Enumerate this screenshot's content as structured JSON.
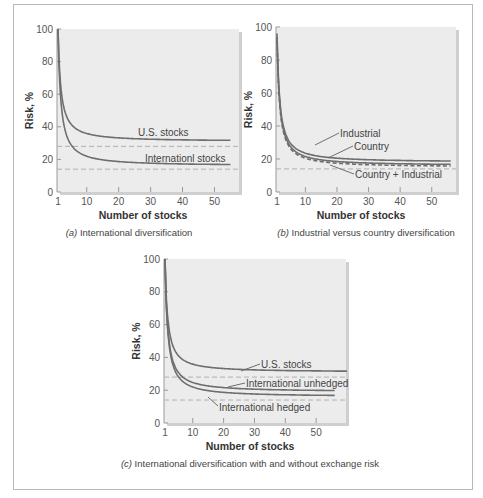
{
  "chart_data": [
    {
      "type": "line",
      "panel": "a",
      "title": "(a) International diversification",
      "caption_letter": "(a)",
      "caption_text": "International diversification",
      "xlabel": "Number of stocks",
      "ylabel": "Risk, %",
      "xlim": [
        1,
        58
      ],
      "ylim": [
        0,
        100
      ],
      "xticks": [
        1,
        10,
        20,
        30,
        40,
        50
      ],
      "yticks": [
        0,
        20,
        40,
        60,
        80,
        100
      ],
      "grid": false,
      "series": [
        {
          "name": "U.S. stocks",
          "asymptote": 31,
          "x": [
            1,
            2,
            3,
            5,
            10,
            20,
            30,
            40,
            50,
            55
          ],
          "values": [
            100,
            62,
            49,
            40,
            35,
            33,
            32,
            31.5,
            31,
            31
          ]
        },
        {
          "name": "Internationl stocks",
          "asymptote": 16,
          "x": [
            1,
            2,
            3,
            5,
            10,
            20,
            30,
            40,
            50,
            55
          ],
          "values": [
            100,
            55,
            40,
            28,
            21,
            18,
            17,
            16.5,
            16,
            16
          ]
        }
      ],
      "reference_lines": [
        {
          "y": 28,
          "style": "dashed"
        },
        {
          "y": 14,
          "style": "dashed"
        }
      ]
    },
    {
      "type": "line",
      "panel": "b",
      "title": "(b) Industrial versus country diversification",
      "caption_letter": "(b)",
      "caption_text": "Industrial versus country diversification",
      "xlabel": "Number of stocks",
      "ylabel": "Risk, %",
      "xlim": [
        1,
        58
      ],
      "ylim": [
        0,
        100
      ],
      "xticks": [
        1,
        10,
        20,
        30,
        40,
        50
      ],
      "yticks": [
        0,
        20,
        40,
        60,
        80,
        100
      ],
      "grid": false,
      "series": [
        {
          "name": "Industrial",
          "asymptote": 18,
          "x": [
            1,
            2,
            3,
            5,
            10,
            20,
            30,
            40,
            50,
            56
          ],
          "values": [
            96,
            70,
            55,
            40,
            28,
            22,
            20,
            19,
            18.5,
            18
          ]
        },
        {
          "name": "Country",
          "asymptote": 16,
          "x": [
            1,
            2,
            3,
            5,
            10,
            20,
            30,
            40,
            50,
            56
          ],
          "values": [
            94,
            62,
            46,
            32,
            22,
            18,
            17,
            16.5,
            16,
            16
          ]
        },
        {
          "name": "Country + Industrial",
          "style": "dashed",
          "asymptote": 15,
          "x": [
            1,
            2,
            3,
            5,
            10,
            20,
            30,
            40,
            50,
            56
          ],
          "values": [
            92,
            56,
            40,
            28,
            19,
            16.5,
            15.5,
            15.2,
            15,
            15
          ]
        }
      ],
      "reference_lines": [
        {
          "y": 14,
          "style": "dashed"
        }
      ]
    },
    {
      "type": "line",
      "panel": "c",
      "title": "(c) International diversification with and without exchange risk",
      "caption_letter": "(c)",
      "caption_text": "International diversification with and without exchange risk",
      "xlabel": "Number of stocks",
      "ylabel": "Risk, %",
      "xlim": [
        1,
        60
      ],
      "ylim": [
        0,
        100
      ],
      "xticks": [
        1,
        10,
        20,
        30,
        40,
        50
      ],
      "yticks": [
        0,
        20,
        40,
        60,
        80,
        100
      ],
      "grid": false,
      "series": [
        {
          "name": "U.S. stocks",
          "asymptote": 31,
          "x": [
            1,
            2,
            3,
            5,
            10,
            20,
            30,
            40,
            50,
            60
          ],
          "values": [
            100,
            62,
            48,
            39,
            34,
            32,
            31.5,
            31,
            31,
            31
          ]
        },
        {
          "name": "International unhedged",
          "asymptote": 19,
          "x": [
            1,
            2,
            3,
            5,
            10,
            20,
            30,
            40,
            50,
            56
          ],
          "values": [
            100,
            55,
            40,
            29,
            23,
            20.5,
            19.8,
            19.3,
            19,
            19
          ]
        },
        {
          "name": "International hedged",
          "asymptote": 16,
          "x": [
            1,
            2,
            3,
            5,
            10,
            20,
            30,
            40,
            50,
            56
          ],
          "values": [
            100,
            52,
            37,
            26,
            20,
            17.5,
            16.8,
            16.3,
            16,
            16
          ]
        }
      ],
      "reference_lines": [
        {
          "y": 28,
          "style": "dashed"
        },
        {
          "y": 14,
          "style": "dashed"
        }
      ]
    }
  ],
  "labels": {
    "a": {
      "us": "U.S. stocks",
      "intl": "Internationl stocks"
    },
    "b": {
      "industrial": "Industrial",
      "country": "Country",
      "combined": "Country + Industrial"
    },
    "c": {
      "us": "U.S. stocks",
      "unhedged": "International unhedged",
      "hedged": "International hedged"
    }
  },
  "colors": {
    "plot_bg": "#ececec",
    "curve": "#6e6e6e",
    "dashed": "#b0b0b0",
    "frame": "#b8b8b8"
  }
}
